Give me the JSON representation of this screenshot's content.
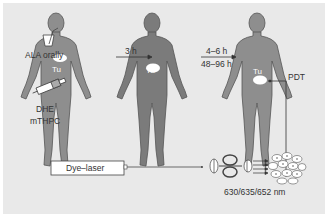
{
  "diagram": {
    "administration": {
      "oral": "ALA orally",
      "injected_line1": "DHE",
      "injected_line2": "mTHPC"
    },
    "tumor_label": "Tu",
    "intervals": {
      "first": "3 h",
      "second_top": "4–6 h",
      "second_bottom": "48–96 h"
    },
    "treatment": "PDT",
    "laser": "Dye–laser",
    "wavelengths": "630/635/652 nm",
    "colors": {
      "background": "#e9e9e9",
      "figure_fill": "#8a8a8a",
      "figure_fill_dark": "#777777",
      "outline": "#555555",
      "tumor": "#ffffff"
    }
  }
}
